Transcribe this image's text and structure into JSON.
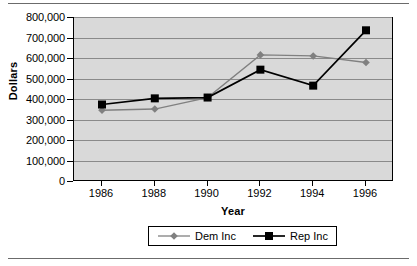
{
  "chart_data": {
    "type": "line",
    "title": "",
    "xlabel": "Year",
    "ylabel": "Dollars",
    "x": [
      1986,
      1988,
      1990,
      1992,
      1994,
      1996
    ],
    "categories": [
      "1986",
      "1988",
      "1990",
      "1992",
      "1994",
      "1996"
    ],
    "series": [
      {
        "name": "Dem Inc",
        "color": "#808080",
        "marker": "diamond",
        "values": [
          350000,
          356000,
          412000,
          620000,
          615000,
          583000
        ]
      },
      {
        "name": "Rep Inc",
        "color": "#000000",
        "marker": "square",
        "values": [
          378000,
          408000,
          412000,
          548000,
          470000,
          740000
        ]
      }
    ],
    "ylim": [
      0,
      800000
    ],
    "ytick_values": [
      0,
      100000,
      200000,
      300000,
      400000,
      500000,
      600000,
      700000,
      800000
    ],
    "ytick_labels": [
      "0",
      "100,000",
      "200,000",
      "300,000",
      "400,000",
      "500,000",
      "600,000",
      "700,000",
      "800,000"
    ],
    "grid": "horizontal",
    "legend_position": "bottom",
    "plot_background": "#d9d9d9",
    "page_background": "#ffffff"
  }
}
